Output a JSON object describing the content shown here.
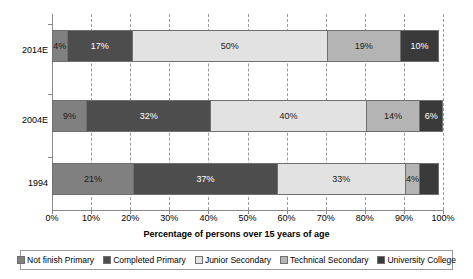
{
  "chart_data": {
    "type": "bar",
    "orientation": "horizontal",
    "stacked": true,
    "stack_mode": "percent",
    "title": "",
    "xlabel": "Percentage of persons over 15 years of age",
    "ylabel": "",
    "xlim": [
      0,
      100
    ],
    "xticks": [
      "0%",
      "10%",
      "20%",
      "30%",
      "40%",
      "50%",
      "60%",
      "70%",
      "80%",
      "90%",
      "100%"
    ],
    "xtick_values": [
      0,
      10,
      20,
      30,
      40,
      50,
      60,
      70,
      80,
      90,
      100
    ],
    "grid": "vertical-dashed",
    "legend_position": "bottom",
    "categories": [
      "2014E",
      "2004E",
      "1994"
    ],
    "series": [
      {
        "name": "Not finish Primary",
        "color": "#808080",
        "values": [
          4,
          9,
          21
        ],
        "labels": [
          "4%",
          "9%",
          "21%"
        ]
      },
      {
        "name": "Completed Primary",
        "color": "#4d4d4d",
        "values": [
          17,
          32,
          37
        ],
        "labels": [
          "17%",
          "37%",
          "37%"
        ]
      },
      {
        "name": "Junior Secondary",
        "color": "#e2e2e2",
        "values": [
          50,
          40,
          33
        ],
        "labels": [
          "50%",
          "40%",
          "33%"
        ]
      },
      {
        "name": "Technical Secondary",
        "color": "#b4b4b4",
        "values": [
          19,
          14,
          4
        ],
        "labels": [
          "19%",
          "14%",
          "4%"
        ]
      },
      {
        "name": "University College",
        "color": "#3a3a3a",
        "values": [
          10,
          6,
          5
        ],
        "labels": [
          "10%",
          "6%",
          ""
        ]
      }
    ],
    "bars": [
      {
        "category": "2014E",
        "segments": [
          {
            "series": "Not finish Primary",
            "value": 4,
            "label": "4%",
            "color": "#808080",
            "text_tone": "dark"
          },
          {
            "series": "Completed Primary",
            "value": 17,
            "label": "17%",
            "color": "#4d4d4d",
            "text_tone": "light"
          },
          {
            "series": "Junior Secondary",
            "value": 50,
            "label": "50%",
            "color": "#e2e2e2",
            "text_tone": "dark"
          },
          {
            "series": "Technical Secondary",
            "value": 19,
            "label": "19%",
            "color": "#b4b4b4",
            "text_tone": "dark"
          },
          {
            "series": "University College",
            "value": 10,
            "label": "10%",
            "color": "#3a3a3a",
            "text_tone": "light"
          }
        ]
      },
      {
        "category": "2004E",
        "segments": [
          {
            "series": "Not finish Primary",
            "value": 9,
            "label": "9%",
            "color": "#808080",
            "text_tone": "dark"
          },
          {
            "series": "Completed Primary",
            "value": 32,
            "label": "32%",
            "color": "#4d4d4d",
            "text_tone": "light"
          },
          {
            "series": "Junior Secondary",
            "value": 40,
            "label": "40%",
            "color": "#e2e2e2",
            "text_tone": "dark"
          },
          {
            "series": "Technical Secondary",
            "value": 14,
            "label": "14%",
            "color": "#b4b4b4",
            "text_tone": "dark"
          },
          {
            "series": "University College",
            "value": 6,
            "label": "6%",
            "color": "#3a3a3a",
            "text_tone": "light"
          }
        ]
      },
      {
        "category": "1994",
        "segments": [
          {
            "series": "Not finish Primary",
            "value": 21,
            "label": "21%",
            "color": "#808080",
            "text_tone": "dark"
          },
          {
            "series": "Completed Primary",
            "value": 37,
            "label": "37%",
            "color": "#4d4d4d",
            "text_tone": "light"
          },
          {
            "series": "Junior Secondary",
            "value": 33,
            "label": "33%",
            "color": "#e2e2e2",
            "text_tone": "dark"
          },
          {
            "series": "Technical Secondary",
            "value": 4,
            "label": "4%",
            "color": "#b4b4b4",
            "text_tone": "dark"
          },
          {
            "series": "University College",
            "value": 5,
            "label": "",
            "color": "#3a3a3a",
            "text_tone": "light"
          }
        ]
      }
    ],
    "legend": [
      {
        "label": "Not finish Primary",
        "color": "#808080"
      },
      {
        "label": "Completed Primary",
        "color": "#4d4d4d"
      },
      {
        "label": "Junior Secondary",
        "color": "#e2e2e2"
      },
      {
        "label": "Technical Secondary",
        "color": "#b4b4b4"
      },
      {
        "label": "University College",
        "color": "#3a3a3a"
      }
    ]
  }
}
